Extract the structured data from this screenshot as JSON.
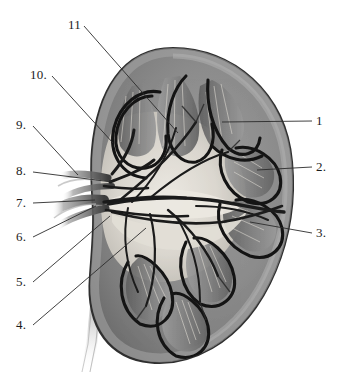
{
  "figure": {
    "style": "grayscale medical illustration",
    "width": 347,
    "height": 379,
    "background_color": "#ffffff"
  },
  "colors": {
    "background": "#ffffff",
    "capsule_outline": "#3a3a3a",
    "cortex": "#8d8d8d",
    "cortex_light": "#a3a3a3",
    "medulla_pyramid": "#6f6f6f",
    "renal_sinus": "#d9d5cd",
    "pelvis_light": "#e6e2da",
    "vessel_dark": "#1a1a1a",
    "vessel_mid": "#4a4a4a",
    "ureter": "#b9b9b9",
    "leader_line": "#2b2b2b",
    "label_text": "#1c1c1c"
  },
  "labels": [
    {
      "id": "11",
      "text": "11",
      "x": 68,
      "y": 18,
      "anchor": "left",
      "tip_x": 178,
      "tip_y": 133
    },
    {
      "id": "10",
      "text": "10.",
      "x": 30,
      "y": 68,
      "anchor": "left",
      "tip_x": 113,
      "tip_y": 143
    },
    {
      "id": "9",
      "text": "9.",
      "x": 16,
      "y": 118,
      "anchor": "left",
      "tip_x": 78,
      "tip_y": 175
    },
    {
      "id": "8",
      "text": "8.",
      "x": 16,
      "y": 164,
      "anchor": "left",
      "tip_x": 112,
      "tip_y": 182
    },
    {
      "id": "7",
      "text": "7.",
      "x": 16,
      "y": 196,
      "anchor": "left",
      "tip_x": 95,
      "tip_y": 200
    },
    {
      "id": "6",
      "text": "6.",
      "x": 16,
      "y": 230,
      "anchor": "left",
      "tip_x": 96,
      "tip_y": 206
    },
    {
      "id": "5",
      "text": "5.",
      "x": 16,
      "y": 275,
      "anchor": "left",
      "tip_x": 110,
      "tip_y": 216
    },
    {
      "id": "4",
      "text": "4.",
      "x": 16,
      "y": 318,
      "anchor": "left",
      "tip_x": 146,
      "tip_y": 228
    },
    {
      "id": "1",
      "text": "1",
      "x": 316,
      "y": 114,
      "anchor": "right",
      "tip_x": 222,
      "tip_y": 122
    },
    {
      "id": "2",
      "text": "2.",
      "x": 316,
      "y": 160,
      "anchor": "right",
      "tip_x": 257,
      "tip_y": 170
    },
    {
      "id": "3",
      "text": "3.",
      "x": 316,
      "y": 226,
      "anchor": "right",
      "tip_x": 250,
      "tip_y": 222
    }
  ],
  "anatomy_parts": [
    {
      "name": "renal-capsule"
    },
    {
      "name": "renal-cortex"
    },
    {
      "name": "renal-medulla-pyramid"
    },
    {
      "name": "renal-column"
    },
    {
      "name": "minor-calyx"
    },
    {
      "name": "major-calyx"
    },
    {
      "name": "renal-pelvis"
    },
    {
      "name": "renal-artery"
    },
    {
      "name": "renal-vein"
    },
    {
      "name": "segmental-vessels"
    },
    {
      "name": "ureter"
    },
    {
      "name": "renal-papilla"
    },
    {
      "name": "renal-sinus"
    }
  ]
}
